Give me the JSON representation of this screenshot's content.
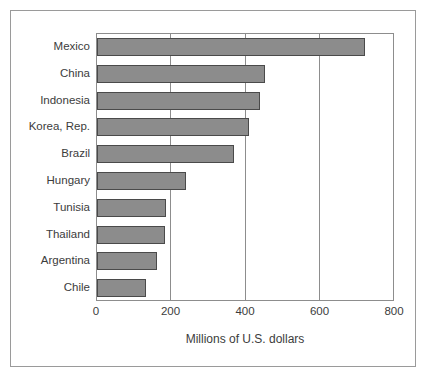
{
  "chart_data": {
    "type": "bar",
    "orientation": "horizontal",
    "title": "",
    "xlabel": "Millions of U.S. dollars",
    "ylabel": "",
    "categories": [
      "Mexico",
      "China",
      "Indonesia",
      "Korea, Rep.",
      "Brazil",
      "Hungary",
      "Tunisia",
      "Thailand",
      "Argentina",
      "Chile"
    ],
    "values": [
      725,
      455,
      440,
      410,
      370,
      240,
      187,
      185,
      162,
      133
    ],
    "xlim": [
      0,
      800
    ],
    "xticks": [
      0,
      200,
      400,
      600,
      800
    ],
    "xtick_labels": [
      "0",
      "200",
      "400",
      "600",
      "800"
    ],
    "grid": "vertical",
    "legend": null,
    "bar_color": "#8c8c8c",
    "bar_border_color": "#4a4a4a",
    "axis_color": "#8d8d8d",
    "frame_color": "#9a9a9a",
    "background": "#ffffff"
  }
}
